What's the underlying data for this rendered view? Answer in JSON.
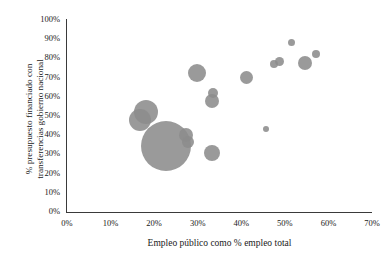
{
  "chart_data": {
    "type": "scatter",
    "title": "",
    "xlabel": "Empleo público como % empleo total",
    "ylabel_line1": "% presupuesto financiado con",
    "ylabel_line2": "transferencias gobierno nacional",
    "xlim": [
      0,
      70
    ],
    "ylim": [
      0,
      100
    ],
    "xticks": [
      "0%",
      "10%",
      "20%",
      "30%",
      "40%",
      "50%",
      "60%",
      "70%"
    ],
    "xtick_values": [
      0,
      10,
      20,
      30,
      40,
      50,
      60,
      70
    ],
    "yticks": [
      "0%",
      "10%",
      "20%",
      "30%",
      "40%",
      "50%",
      "60%",
      "70%",
      "80%",
      "90%",
      "100%"
    ],
    "ytick_values": [
      0,
      10,
      20,
      30,
      40,
      50,
      60,
      70,
      80,
      90,
      100
    ],
    "grid": false,
    "legend": "none",
    "marker_color": "#8c8c8c",
    "points": [
      {
        "x": 22.7,
        "y": 34.4,
        "r": 25.0
      },
      {
        "x": 18.1,
        "y": 52.1,
        "r": 12.0
      },
      {
        "x": 16.8,
        "y": 47.9,
        "r": 11.0
      },
      {
        "x": 27.3,
        "y": 40.1,
        "r": 7.0
      },
      {
        "x": 27.8,
        "y": 36.5,
        "r": 6.0
      },
      {
        "x": 29.8,
        "y": 72.4,
        "r": 9.0
      },
      {
        "x": 33.5,
        "y": 62.0,
        "r": 5.0
      },
      {
        "x": 33.3,
        "y": 57.8,
        "r": 7.0
      },
      {
        "x": 33.3,
        "y": 30.7,
        "r": 8.0
      },
      {
        "x": 41.1,
        "y": 69.8,
        "r": 6.5
      },
      {
        "x": 45.7,
        "y": 43.2,
        "r": 3.0
      },
      {
        "x": 47.5,
        "y": 77.1,
        "r": 4.0
      },
      {
        "x": 48.7,
        "y": 78.6,
        "r": 4.5
      },
      {
        "x": 51.6,
        "y": 88.5,
        "r": 3.5
      },
      {
        "x": 54.6,
        "y": 77.6,
        "r": 7.0
      },
      {
        "x": 57.1,
        "y": 82.3,
        "r": 4.0
      }
    ]
  }
}
